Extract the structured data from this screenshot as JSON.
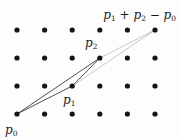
{
  "figure": {
    "caption": "Lattice parallelogram construction",
    "colors": {
      "background": "#fdfdfd",
      "dot": "#141414",
      "solid_edge": "#3c3c3c",
      "thin_edge": "#a9a9a9",
      "label": "#1a1a1a"
    },
    "grid": {
      "columns": 6,
      "rows": 4,
      "origin_x": 17,
      "origin_y": 30,
      "spacing_x": 27.6,
      "spacing_y": 28,
      "dot_radius": 2.6
    },
    "points": [
      {
        "id": "p0",
        "col": 0,
        "row": 3
      },
      {
        "id": "p1",
        "col": 2,
        "row": 2
      },
      {
        "id": "p2",
        "col": 3,
        "row": 1
      },
      {
        "id": "sum",
        "col": 5,
        "row": 0
      }
    ],
    "edges": [
      {
        "from": "p0",
        "to": "p1",
        "style": "solid"
      },
      {
        "from": "p0",
        "to": "p2",
        "style": "solid"
      },
      {
        "from": "p1",
        "to": "p2",
        "style": "solid"
      },
      {
        "from": "p1",
        "to": "sum",
        "style": "thin"
      },
      {
        "from": "p2",
        "to": "sum",
        "style": "thin"
      }
    ],
    "edge_widths": {
      "solid": 0.9,
      "thin": 0.65
    },
    "labels": [
      {
        "id": "label-sum",
        "x": 176,
        "y": 19,
        "anchor": "end",
        "font_size": 12,
        "parts": [
          {
            "text": "p",
            "kind": "var"
          },
          {
            "text": "1",
            "kind": "sub"
          },
          {
            "text": " + ",
            "kind": "op"
          },
          {
            "text": "p",
            "kind": "var"
          },
          {
            "text": "2",
            "kind": "sub"
          },
          {
            "text": " − ",
            "kind": "op"
          },
          {
            "text": "p",
            "kind": "var"
          },
          {
            "text": "0",
            "kind": "sub"
          }
        ]
      },
      {
        "id": "label-p2",
        "x": 85,
        "y": 47,
        "anchor": "start",
        "font_size": 12,
        "parts": [
          {
            "text": "p",
            "kind": "var"
          },
          {
            "text": "2",
            "kind": "sub"
          }
        ]
      },
      {
        "id": "label-p1",
        "x": 63,
        "y": 104,
        "anchor": "start",
        "font_size": 12,
        "parts": [
          {
            "text": "p",
            "kind": "var"
          },
          {
            "text": "1",
            "kind": "sub"
          }
        ]
      },
      {
        "id": "label-p0",
        "x": 5,
        "y": 134,
        "anchor": "start",
        "font_size": 12,
        "parts": [
          {
            "text": "p",
            "kind": "var"
          },
          {
            "text": "0",
            "kind": "sub"
          }
        ]
      }
    ]
  }
}
